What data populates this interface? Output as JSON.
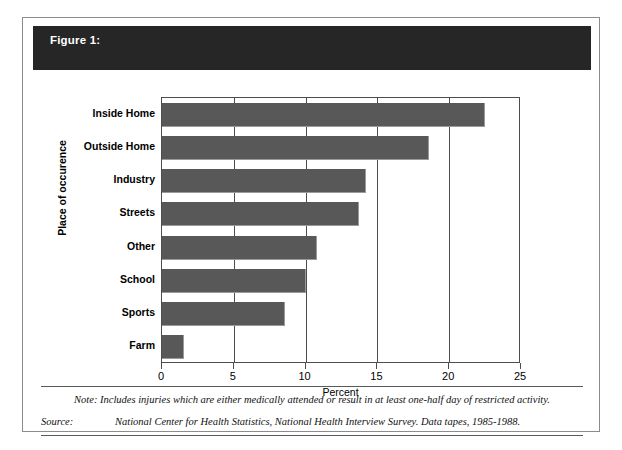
{
  "figure": {
    "number_label": "Figure 1:",
    "title_line_1": "Percent Distribution of Place of Occurence, All Injuries",
    "title_line_2": "United States, 1985-1988",
    "banner_color": "#262626",
    "frame_color": "#8c8c8c"
  },
  "chart_data": {
    "type": "bar",
    "orientation": "horizontal",
    "title": "Percent Distribution of Place of Occurence, All Injuries United States, 1985-1988",
    "xlabel": "Percent",
    "ylabel": "Place of occurence",
    "categories": [
      "Inside Home",
      "Outside Home",
      "Industry",
      "Streets",
      "Other",
      "School",
      "Sports",
      "Farm"
    ],
    "values": [
      22.5,
      18.6,
      14.2,
      13.7,
      10.8,
      10.0,
      8.6,
      1.5
    ],
    "xlim": [
      0,
      25
    ],
    "xticks": [
      0,
      5,
      10,
      15,
      20,
      25
    ],
    "xtick_labels": [
      "0",
      "5",
      "10",
      "15",
      "20",
      "25"
    ],
    "grid": true,
    "grid_axis": "x",
    "legend": null,
    "bar_color": "#585858"
  },
  "footer": {
    "note_text": "Note: Includes injuries which are either medically attended or result in at least one-half day of restricted activity.",
    "source_label": "Source:",
    "source_text": "National Center for Health Statistics, National Health Interview Survey.  Data tapes, 1985-1988."
  }
}
